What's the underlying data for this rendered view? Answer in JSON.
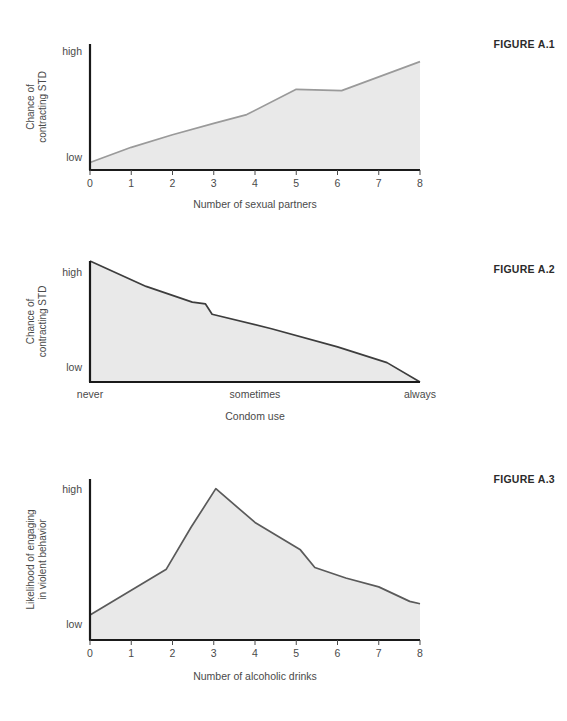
{
  "page": {
    "background_color": "#ffffff",
    "figures": [
      {
        "id": "figure-1",
        "caption": "FIGURE A.1",
        "chart": {
          "type": "area",
          "title": "",
          "xlabel": "Number of sexual partners",
          "ylabel_lines": [
            "Chance of",
            "contracting STD"
          ],
          "ylabel": "Chance of contracting STD",
          "x_tick_labels": [
            "0",
            "1",
            "2",
            "3",
            "4",
            "5",
            "6",
            "7",
            "8"
          ],
          "x_values": [
            0,
            1,
            2,
            3,
            4,
            5,
            6,
            7,
            8
          ],
          "y_tick_labels": [
            "low",
            "high"
          ],
          "ylim": [
            0,
            1
          ],
          "xlim": [
            0,
            8
          ],
          "grid": false,
          "legend": "none",
          "line_color": "#9a9a9a",
          "fill_color": "#e9e9e9",
          "axis_color": "#1a1a1a",
          "series": [
            {
              "name": "Chance of contracting STD",
              "x": [
                0,
                1,
                2,
                3,
                3.8,
                5,
                6.1,
                8
              ],
              "values": [
                0.06,
                0.18,
                0.28,
                0.37,
                0.44,
                0.64,
                0.63,
                0.86
              ]
            }
          ]
        }
      },
      {
        "id": "figure-2",
        "caption": "FIGURE A.2",
        "chart": {
          "type": "area",
          "title": "",
          "xlabel": "Condom use",
          "ylabel_lines": [
            "Chance of",
            "contracting STD"
          ],
          "ylabel": "Chance of contracting STD",
          "x_tick_labels": [
            "never",
            "sometimes",
            "always"
          ],
          "x_values": [
            0,
            0.5,
            1
          ],
          "y_tick_labels": [
            "low",
            "high"
          ],
          "ylim": [
            0,
            1
          ],
          "xlim": [
            0,
            1
          ],
          "grid": false,
          "legend": "none",
          "line_color": "#3d3d3d",
          "fill_color": "#e9e9e9",
          "axis_color": "#1a1a1a",
          "series": [
            {
              "name": "Chance of contracting STD",
              "x": [
                0.0,
                0.17,
                0.31,
                0.35,
                0.37,
                0.55,
                0.75,
                0.9,
                1.0
              ],
              "values": [
                1.0,
                0.79,
                0.66,
                0.645,
                0.56,
                0.44,
                0.29,
                0.16,
                0.0
              ]
            }
          ]
        }
      },
      {
        "id": "figure-3",
        "caption": "FIGURE A.3",
        "chart": {
          "type": "area",
          "title": "",
          "xlabel": "Number of alcoholic drinks",
          "ylabel_lines": [
            "Likelihood of engaging",
            "in violent behavior"
          ],
          "ylabel": "Likelihood of engaging in violent behavior",
          "x_tick_labels": [
            "0",
            "1",
            "2",
            "3",
            "4",
            "5",
            "6",
            "7",
            "8"
          ],
          "x_values": [
            0,
            1,
            2,
            3,
            4,
            5,
            6,
            7,
            8
          ],
          "y_tick_labels": [
            "low",
            "high"
          ],
          "ylim": [
            0,
            1
          ],
          "xlim": [
            0,
            8
          ],
          "grid": false,
          "legend": "none",
          "line_color": "#5a5a5a",
          "fill_color": "#e9e9e9",
          "axis_color": "#1a1a1a",
          "series": [
            {
              "name": "Likelihood of engaging in violent behavior",
              "x": [
                0,
                1.85,
                2.45,
                3.05,
                4.0,
                5.1,
                5.45,
                6.2,
                7.0,
                7.75,
                8.0
              ],
              "values": [
                0.155,
                0.44,
                0.7,
                0.94,
                0.73,
                0.56,
                0.45,
                0.385,
                0.33,
                0.24,
                0.225
              ]
            }
          ]
        }
      }
    ]
  },
  "chart_data": [
    {
      "type": "area",
      "title": "FIGURE A.1",
      "xlabel": "Number of sexual partners",
      "ylabel": "Chance of contracting STD",
      "categories": [
        "0",
        "1",
        "2",
        "3",
        "4",
        "5",
        "6",
        "7",
        "8"
      ],
      "x": [
        0,
        1,
        2,
        3,
        3.8,
        5,
        6.1,
        8
      ],
      "values": [
        0.06,
        0.18,
        0.28,
        0.37,
        0.44,
        0.64,
        0.63,
        0.86
      ],
      "ylim": [
        0,
        1
      ],
      "xlim": [
        0,
        8
      ],
      "ytick_labels": [
        "low",
        "high"
      ],
      "grid": false,
      "legend": "none"
    },
    {
      "type": "area",
      "title": "FIGURE A.2",
      "xlabel": "Condom use",
      "ylabel": "Chance of contracting STD",
      "categories": [
        "never",
        "sometimes",
        "always"
      ],
      "x": [
        0.0,
        0.17,
        0.31,
        0.35,
        0.37,
        0.55,
        0.75,
        0.9,
        1.0
      ],
      "values": [
        1.0,
        0.79,
        0.66,
        0.645,
        0.56,
        0.44,
        0.29,
        0.16,
        0.0
      ],
      "ylim": [
        0,
        1
      ],
      "xlim": [
        0,
        1
      ],
      "ytick_labels": [
        "low",
        "high"
      ],
      "grid": false,
      "legend": "none"
    },
    {
      "type": "area",
      "title": "FIGURE A.3",
      "xlabel": "Number of alcoholic drinks",
      "ylabel": "Likelihood of engaging in violent behavior",
      "categories": [
        "0",
        "1",
        "2",
        "3",
        "4",
        "5",
        "6",
        "7",
        "8"
      ],
      "x": [
        0,
        1.85,
        2.45,
        3.05,
        4.0,
        5.1,
        5.45,
        6.2,
        7.0,
        7.75,
        8.0
      ],
      "values": [
        0.155,
        0.44,
        0.7,
        0.94,
        0.73,
        0.56,
        0.45,
        0.385,
        0.33,
        0.24,
        0.225
      ],
      "ylim": [
        0,
        1
      ],
      "xlim": [
        0,
        8
      ],
      "ytick_labels": [
        "low",
        "high"
      ],
      "grid": false,
      "legend": "none"
    }
  ]
}
